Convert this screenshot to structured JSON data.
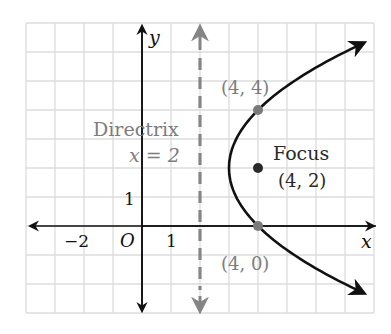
{
  "chart_data": {
    "type": "line",
    "title": "",
    "xlabel": "x",
    "ylabel": "y",
    "xlim": [
      -4,
      8
    ],
    "ylim": [
      -3,
      7
    ],
    "grid": true,
    "tick_labels": {
      "x": [
        {
          "value": -2,
          "label": "−2"
        },
        {
          "value": 1,
          "label": "1"
        }
      ],
      "y": [
        {
          "value": 1,
          "label": "1"
        }
      ],
      "origin": "O"
    },
    "series": [
      {
        "name": "parabola",
        "equation": "(y - 2)^2 = 4(x - 3)",
        "vertex": [
          3,
          2
        ],
        "opens": "right",
        "color": "#111111"
      }
    ],
    "directrix": {
      "label_line1": "Directrix",
      "label_line2": "x = 2",
      "x": 2,
      "style": "dashed",
      "color": "#808080"
    },
    "points": [
      {
        "name": "focus",
        "x": 4,
        "y": 2,
        "label": "(4, 2)",
        "title": "Focus",
        "color": "#2a2a2a"
      },
      {
        "name": "point-upper",
        "x": 4,
        "y": 4,
        "label": "(4, 4)",
        "color": "#7a7a7a"
      },
      {
        "name": "point-lower",
        "x": 4,
        "y": 0,
        "label": "(4, 0)",
        "color": "#7a7a7a"
      }
    ]
  },
  "labels": {
    "x_axis": "x",
    "y_axis": "y",
    "origin": "O",
    "tick_neg2": "−2",
    "tick_x1": "1",
    "tick_y1": "1",
    "directrix_1": "Directrix",
    "directrix_2": "x = 2",
    "focus_title": "Focus",
    "focus_coords": "(4, 2)",
    "upper_point": "(4, 4)",
    "lower_point": "(4, 0)"
  },
  "colors": {
    "grid": "#dcdcdc",
    "axis": "#111111",
    "curve": "#111111",
    "directrix": "#858585",
    "gray_text": "#7d7d7d",
    "dark_text": "#2a2a2a"
  }
}
